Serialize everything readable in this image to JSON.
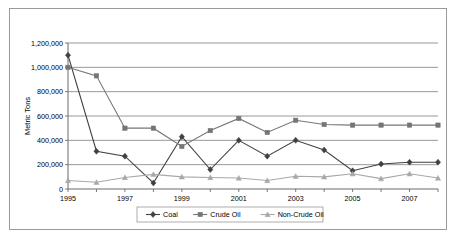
{
  "chart_data": {
    "type": "line",
    "title": "",
    "xlabel": "",
    "ylabel": "Metric Tons",
    "x": [
      1995,
      1996,
      1997,
      1998,
      1999,
      2000,
      2001,
      2002,
      2003,
      2004,
      2005,
      2006,
      2007,
      2008
    ],
    "xtick_labels": [
      "1995",
      "1997",
      "1999",
      "2001",
      "2003",
      "2005",
      "2007"
    ],
    "xticks": [
      1995,
      1997,
      1999,
      2001,
      2003,
      2005,
      2007
    ],
    "ytick_labels": [
      "0",
      "200,000",
      "400,000",
      "600,000",
      "800,000",
      "1,000,000",
      "1,200,000"
    ],
    "yticks": [
      0,
      200000,
      400000,
      600000,
      800000,
      1000000,
      1200000
    ],
    "ylim": [
      0,
      1200000
    ],
    "xlim": [
      1995,
      2008
    ],
    "grid": true,
    "legend_position": "bottom",
    "series": [
      {
        "name": "Coal",
        "marker": "diamond",
        "color": "#404040",
        "values": [
          1100000,
          310000,
          270000,
          50000,
          430000,
          160000,
          400000,
          270000,
          400000,
          320000,
          150000,
          205000,
          220000,
          220000
        ]
      },
      {
        "name": "Crude Oil",
        "marker": "square",
        "color": "#757575",
        "values": [
          1000000,
          930000,
          500000,
          500000,
          350000,
          480000,
          580000,
          465000,
          565000,
          530000,
          525000,
          525000,
          525000,
          525000
        ]
      },
      {
        "name": "Non-Crude Oil",
        "marker": "triangle",
        "color": "#a8a8a8",
        "values": [
          70000,
          55000,
          95000,
          120000,
          100000,
          95000,
          90000,
          70000,
          105000,
          100000,
          125000,
          85000,
          125000,
          90000
        ]
      }
    ]
  },
  "legend": {
    "entries": [
      {
        "label": "Coal"
      },
      {
        "label": "Crude Oil"
      },
      {
        "label": "Non-Crude Oil"
      }
    ]
  }
}
